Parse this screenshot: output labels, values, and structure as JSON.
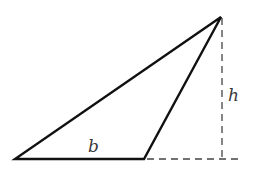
{
  "diagram": {
    "type": "obtuse-triangle-area",
    "colors": {
      "stroke": "#111111",
      "dash": "#444444",
      "label": "#3a3a3a",
      "background": "#ffffff"
    },
    "vertices": {
      "bottom_left": [
        15,
        159
      ],
      "bottom_right": [
        144,
        159
      ],
      "apex": [
        221,
        17
      ]
    },
    "base": {
      "label": "b"
    },
    "height": {
      "label": "h"
    },
    "extension_line": {
      "from": [
        144,
        159
      ],
      "to": [
        242,
        159
      ]
    },
    "altitude_line": {
      "from": [
        222,
        18
      ],
      "to": [
        222,
        159
      ]
    }
  }
}
